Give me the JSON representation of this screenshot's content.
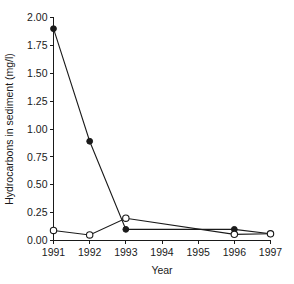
{
  "chart_data": {
    "type": "line",
    "title": "",
    "subtitle": "",
    "xlabel": "Year",
    "ylabel": "Hydrocarbons in sediment (mg/l)",
    "x": [
      1991,
      1992,
      1993,
      1994,
      1995,
      1996,
      1997
    ],
    "categories": [
      "1991",
      "1992",
      "1993",
      "1994",
      "1995",
      "1996",
      "1997"
    ],
    "xlim": [
      1991,
      1997
    ],
    "ylim": [
      0.0,
      2.0
    ],
    "yticks": [
      0.0,
      0.25,
      0.5,
      0.75,
      1.0,
      1.25,
      1.5,
      1.75,
      2.0
    ],
    "ytick_labels": [
      "0.00",
      "0.25",
      "0.50",
      "0.75",
      "1.00",
      "1.25",
      "1.50",
      "1.75",
      "2.00"
    ],
    "xticks": [
      1991,
      1992,
      1993,
      1994,
      1995,
      1996,
      1997
    ],
    "xtick_labels": [
      "1991",
      "1992",
      "1993",
      "1994",
      "1995",
      "1996",
      "1997"
    ],
    "grid": false,
    "legend": "none",
    "series": [
      {
        "name": "filled-circle-series",
        "marker": "filled-circle",
        "color": "#1a1a1a",
        "x": [
          1991,
          1992,
          1993,
          1996,
          1997
        ],
        "values": [
          1.9,
          0.89,
          0.1,
          0.1,
          0.06
        ]
      },
      {
        "name": "open-circle-series",
        "marker": "open-circle",
        "color": "#1a1a1a",
        "x": [
          1991,
          1992,
          1993,
          1996,
          1997
        ],
        "values": [
          0.09,
          0.05,
          0.2,
          0.055,
          0.06
        ]
      }
    ]
  },
  "axes": {
    "y_title": "Hydrocarbons in sediment (mg/l)",
    "x_title": "Year"
  }
}
